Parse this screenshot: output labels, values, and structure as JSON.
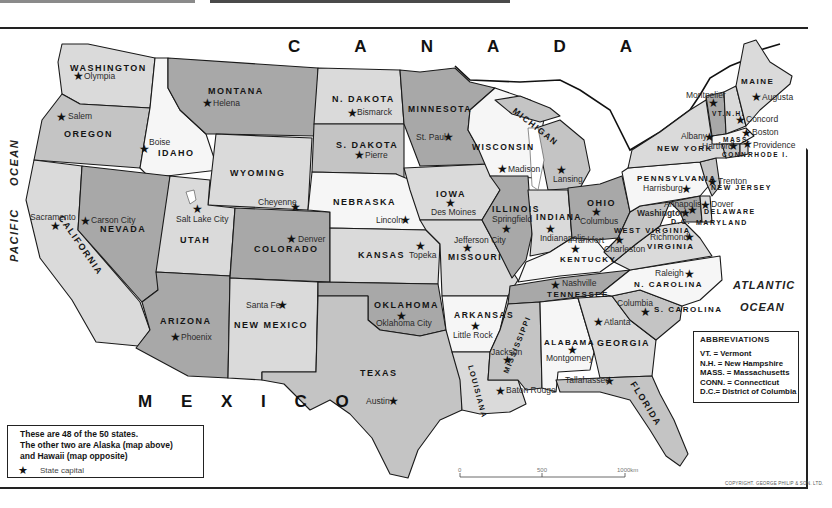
{
  "map": {
    "countries": {
      "north": "C A N A D A",
      "south": "M E X I C O"
    },
    "oceans": {
      "west_1": "PACIFIC",
      "west_2": "OCEAN",
      "east_1": "ATLANTIC",
      "east_2": "OCEAN"
    },
    "colors": {
      "dark": "#a8a8a8",
      "medium": "#c4c4c4",
      "light": "#dadada",
      "white": "#f6f6f6",
      "water": "#ffffff"
    },
    "states": [
      {
        "name": "WASHINGTON",
        "capital": "Olympia",
        "shade": "light"
      },
      {
        "name": "OREGON",
        "capital": "Salem",
        "shade": "medium"
      },
      {
        "name": "CALIFORNIA",
        "capital": "Sacramento",
        "shade": "light"
      },
      {
        "name": "IDAHO",
        "capital": "Boise",
        "shade": "white"
      },
      {
        "name": "NEVADA",
        "capital": "Carson City",
        "shade": "dark"
      },
      {
        "name": "MONTANA",
        "capital": "Helena",
        "shade": "dark"
      },
      {
        "name": "WYOMING",
        "capital": "Cheyenne",
        "shade": "light"
      },
      {
        "name": "UTAH",
        "capital": "Salt Lake City",
        "shade": "light"
      },
      {
        "name": "ARIZONA",
        "capital": "Phoenix",
        "shade": "dark"
      },
      {
        "name": "COLORADO",
        "capital": "Denver",
        "shade": "dark"
      },
      {
        "name": "NEW MEXICO",
        "capital": "Santa Fe",
        "shade": "light"
      },
      {
        "name": "N. DAKOTA",
        "capital": "Bismarck",
        "shade": "light"
      },
      {
        "name": "S. DAKOTA",
        "capital": "Pierre",
        "shade": "medium"
      },
      {
        "name": "NEBRASKA",
        "capital": "Lincoln",
        "shade": "white"
      },
      {
        "name": "KANSAS",
        "capital": "Topeka",
        "shade": "light"
      },
      {
        "name": "OKLAHOMA",
        "capital": "Oklahoma City",
        "shade": "dark"
      },
      {
        "name": "TEXAS",
        "capital": "Austin",
        "shade": "medium"
      },
      {
        "name": "MINNESOTA",
        "capital": "St. Paul",
        "shade": "dark"
      },
      {
        "name": "IOWA",
        "capital": "Des Moines",
        "shade": "light"
      },
      {
        "name": "MISSOURI",
        "capital": "Jefferson City",
        "shade": "light"
      },
      {
        "name": "ARKANSAS",
        "capital": "Little Rock",
        "shade": "white"
      },
      {
        "name": "LOUISIANA",
        "capital": "Baton Rouge",
        "shade": "light"
      },
      {
        "name": "WISCONSIN",
        "capital": "Madison",
        "shade": "white"
      },
      {
        "name": "ILLINOIS",
        "capital": "Springfield",
        "shade": "dark"
      },
      {
        "name": "MICHIGAN",
        "capital": "Lansing",
        "shade": "medium"
      },
      {
        "name": "INDIANA",
        "capital": "Indianapolis",
        "shade": "light"
      },
      {
        "name": "OHIO",
        "capital": "Columbus",
        "shade": "dark"
      },
      {
        "name": "KENTUCKY",
        "capital": "Frankfort",
        "shade": "white"
      },
      {
        "name": "TENNESSEE",
        "capital": "Nashville",
        "shade": "dark"
      },
      {
        "name": "MISSISSIPPI",
        "capital": "Jackson",
        "shade": "medium"
      },
      {
        "name": "ALABAMA",
        "capital": "Montgomery",
        "shade": "white"
      },
      {
        "name": "GEORGIA",
        "capital": "Atlanta",
        "shade": "light"
      },
      {
        "name": "FLORIDA",
        "capital": "Tallahassee",
        "shade": "medium"
      },
      {
        "name": "S. CAROLINA",
        "capital": "Columbia",
        "shade": "medium"
      },
      {
        "name": "N. CAROLINA",
        "capital": "Raleigh",
        "shade": "white"
      },
      {
        "name": "VIRGINIA",
        "capital": "Richmond",
        "shade": "light"
      },
      {
        "name": "WEST VIRGINIA",
        "capital": "Charleston",
        "shade": "medium"
      },
      {
        "name": "PENNSYLVANIA",
        "capital": "Harrisburg",
        "shade": "white"
      },
      {
        "name": "NEW YORK",
        "capital": "Albany",
        "shade": "light"
      },
      {
        "name": "NEW JERSEY",
        "capital": "Trenton",
        "shade": "medium"
      },
      {
        "name": "DELAWARE",
        "capital": "Dover",
        "shade": "light"
      },
      {
        "name": "MARYLAND",
        "capital": "Annapolis",
        "shade": "dark"
      },
      {
        "name": "D.C.",
        "capital": "Washington",
        "shade": "dark"
      },
      {
        "name": "VT.",
        "capital": "Montpelier",
        "shade": "dark"
      },
      {
        "name": "N.H.",
        "capital": "Concord",
        "shade": "light"
      },
      {
        "name": "MAINE",
        "capital": "Augusta",
        "shade": "light"
      },
      {
        "name": "MASS.",
        "capital": "Boston",
        "shade": "white"
      },
      {
        "name": "CONN.",
        "capital": "Hartford",
        "shade": "medium"
      },
      {
        "name": "RHODE I.",
        "capital": "Providence",
        "shade": "light"
      }
    ]
  },
  "legend": {
    "line1": "These are 48 of the 50 states.",
    "line2": "The other two are Alaska (map above)",
    "line3": "and Hawaii (map opposite)",
    "key_icon": "star-icon",
    "key_label": "State capital"
  },
  "abbreviations": {
    "title": "ABBREVIATIONS",
    "items": [
      "VT. = Vermont",
      "N.H. = New Hampshire",
      "MASS. = Massachusetts",
      "CONN. = Connecticut",
      "D.C.= District of Columbia"
    ]
  },
  "scale_bar": {
    "ticks": [
      "0",
      "500",
      "1000km"
    ]
  },
  "copyright": "COPYRIGHT. GEORGE PHILIP & SON. LTD."
}
